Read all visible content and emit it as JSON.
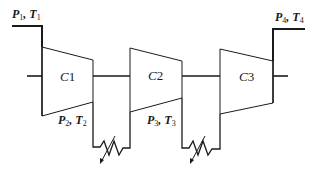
{
  "diagram": {
    "stroke_color": "#1a1a1a",
    "background": "#ffffff",
    "compressors": [
      {
        "id": "C1",
        "prefix": "C",
        "num": "1"
      },
      {
        "id": "C2",
        "prefix": "C",
        "num": "2"
      },
      {
        "id": "C3",
        "prefix": "C",
        "num": "3"
      }
    ],
    "states": [
      {
        "id": "state1",
        "p": "P",
        "p_sub": "1",
        "sep": ", ",
        "t": "T",
        "t_sub": "1",
        "location": "inlet"
      },
      {
        "id": "state2",
        "p": "P",
        "p_sub": "2",
        "sep": ", ",
        "t": "T",
        "t_sub": "2",
        "location": "after C1"
      },
      {
        "id": "state3",
        "p": "P",
        "p_sub": "3",
        "sep": ", ",
        "t": "T",
        "t_sub": "3",
        "location": "after C2"
      },
      {
        "id": "state4",
        "p": "P",
        "p_sub": "4",
        "sep": ", ",
        "t": "T",
        "t_sub": "4",
        "location": "outlet"
      }
    ],
    "intercoolers": [
      {
        "id": "intercooler-1",
        "between": "C1-C2"
      },
      {
        "id": "intercooler-2",
        "between": "C2-C3"
      }
    ],
    "shaft": {
      "label": "common shaft"
    }
  }
}
